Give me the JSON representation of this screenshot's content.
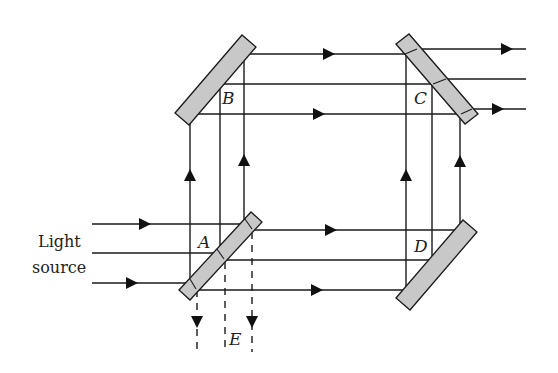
{
  "diagram": {
    "type": "Mach-Zehnder-style interferometer",
    "source_label_line1": "Light",
    "source_label_line2": "source",
    "points": {
      "A": "A",
      "B": "B",
      "C": "C",
      "D": "D",
      "E": "E"
    },
    "components": [
      {
        "id": "A",
        "kind": "beam-splitter",
        "fill": "#c8c8c8"
      },
      {
        "id": "B",
        "kind": "mirror",
        "fill": "#c8c8c8"
      },
      {
        "id": "C",
        "kind": "beam-splitter",
        "fill": "#c8c8c8"
      },
      {
        "id": "D",
        "kind": "mirror",
        "fill": "#c8c8c8"
      }
    ],
    "colors": {
      "line": "#1a1a1a",
      "mirror_fill": "#c8c8c8",
      "background": "#ffffff"
    }
  }
}
